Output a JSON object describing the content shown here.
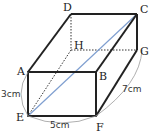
{
  "diagram": {
    "type": "rectangular-prism",
    "vertices": {
      "A": {
        "label": "A",
        "x": 28,
        "y": 72
      },
      "B": {
        "label": "B",
        "x": 96,
        "y": 72
      },
      "C": {
        "label": "C",
        "x": 137,
        "y": 14
      },
      "D": {
        "label": "D",
        "x": 71,
        "y": 14
      },
      "E": {
        "label": "E",
        "x": 28,
        "y": 116
      },
      "F": {
        "label": "F",
        "x": 96,
        "y": 116
      },
      "G": {
        "label": "G",
        "x": 137,
        "y": 50
      },
      "H": {
        "label": "H",
        "x": 71,
        "y": 50
      }
    },
    "dimensions": {
      "height": "3cm",
      "width": "5cm",
      "depth": "7cm"
    },
    "diagonal": {
      "from": "E",
      "to": "C",
      "color": "#7f9fd0"
    },
    "colors": {
      "edge": "#222222",
      "hidden_edge": "#333333",
      "dimension_arc": "#9a9a9a"
    }
  }
}
